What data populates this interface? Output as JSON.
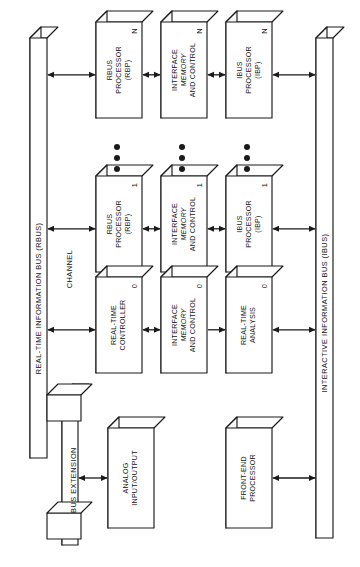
{
  "figure": {
    "orientation": "rotated-90-ccw",
    "colors": {
      "ink": "#1a1a1a",
      "paper": "#ffffff",
      "face": "#ffffff",
      "shade": "#f7f7f7"
    }
  },
  "buses": [
    {
      "id": "rbus",
      "label": "REAL-TIME INFORMATION BUS (RBUS)"
    },
    {
      "id": "ibus",
      "label": "INTERACTIVE INFORMATION BUS (IBUS)"
    }
  ],
  "annotations": [
    {
      "id": "channel",
      "label": "CHANNEL"
    },
    {
      "id": "bus-extension",
      "label": "BUS EXTENSION"
    }
  ],
  "columns": [
    {
      "id": "col-rbp",
      "name": "RBUS processors"
    },
    {
      "id": "col-imc",
      "name": "Interface memory and control"
    },
    {
      "id": "col-ibp",
      "name": "IBUS processors"
    }
  ],
  "rows": [
    {
      "id": "row-n",
      "index": "N"
    },
    {
      "id": "row-1",
      "index": "1"
    },
    {
      "id": "row-0",
      "index": "0"
    }
  ],
  "blocks": {
    "rbp_n": {
      "lines": [
        "RBUS",
        "PROCESSOR",
        "(RBP)"
      ],
      "italic": [],
      "index": "N"
    },
    "imc_n": {
      "lines": [
        "INTERFACE",
        "MEMORY",
        "AND CONTROL"
      ],
      "italic": [
        1
      ],
      "index": "N"
    },
    "ibp_n": {
      "lines": [
        "IBUS",
        "PROCESSOR",
        "(IBP)"
      ],
      "italic": [],
      "index": "N"
    },
    "rbp_1": {
      "lines": [
        "RBUS",
        "PROCESSOR",
        "(RBP)"
      ],
      "italic": [],
      "index": "1"
    },
    "imc_1": {
      "lines": [
        "INTERFACE",
        "MEMORY",
        "AND CONTROL"
      ],
      "italic": [
        1
      ],
      "index": "1"
    },
    "ibp_1": {
      "lines": [
        "IBUS",
        "PROCESSOR",
        "(IBP)"
      ],
      "italic": [],
      "index": "1"
    },
    "rtc_0": {
      "lines": [
        "REAL-TIME",
        "CONTROLLER"
      ],
      "italic": [],
      "index": "0"
    },
    "imc_0": {
      "lines": [
        "INTERFACE",
        "MEMORY",
        "AND CONTROL"
      ],
      "italic": [
        1
      ],
      "index": "0"
    },
    "rta_0": {
      "lines": [
        "REAL-TIME",
        "ANALYSIS"
      ],
      "italic": [],
      "index": "0"
    },
    "aio": {
      "lines": [
        "ANALOG",
        "INPUT/OUTPUT"
      ],
      "italic": [],
      "index": ""
    },
    "fep": {
      "lines": [
        "FRONT-END",
        "PROCESSOR"
      ],
      "italic": [],
      "index": ""
    }
  },
  "ellipsis": {
    "dot_count": 3,
    "columns": [
      "col-rbp",
      "col-imc",
      "col-ibp"
    ]
  },
  "connections": [
    {
      "from": "rbus",
      "to": "rbp_n",
      "arrows": "both"
    },
    {
      "from": "rbp_n",
      "to": "imc_n",
      "arrows": "both"
    },
    {
      "from": "imc_n",
      "to": "ibp_n",
      "arrows": "both"
    },
    {
      "from": "ibp_n",
      "to": "ibus",
      "arrows": "both"
    },
    {
      "from": "rbus",
      "to": "rbp_1",
      "arrows": "both"
    },
    {
      "from": "rbp_1",
      "to": "imc_1",
      "arrows": "both"
    },
    {
      "from": "imc_1",
      "to": "ibp_1",
      "arrows": "both"
    },
    {
      "from": "ibp_1",
      "to": "ibus",
      "arrows": "both"
    },
    {
      "from": "rbus",
      "to": "rtc_0",
      "arrows": "both"
    },
    {
      "from": "rtc_0",
      "to": "imc_0",
      "arrows": "both"
    },
    {
      "from": "imc_0",
      "to": "rta_0",
      "arrows": "single"
    },
    {
      "from": "rta_0",
      "to": "ibus",
      "arrows": "both"
    },
    {
      "from": "bus-extension",
      "to": "aio",
      "arrows": "both"
    },
    {
      "from": "ibus",
      "to": "fep",
      "arrows": "both"
    }
  ]
}
